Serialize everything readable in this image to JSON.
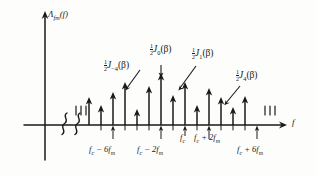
{
  "figure": {
    "kind": "fm-spectrum-line-diagram",
    "y_axis_label": {
      "main": "Λ",
      "sub": "fm",
      "arg": "(f)"
    },
    "x_axis_label": "f"
  },
  "annotations": [
    {
      "id": "j-minus-4",
      "frac_num": "1",
      "frac_den": "2",
      "symbol": "J",
      "order": "−4",
      "arg": "(β)"
    },
    {
      "id": "j-0",
      "frac_num": "1",
      "frac_den": "2",
      "symbol": "J",
      "order": "0",
      "arg": "(β)"
    },
    {
      "id": "j-1",
      "frac_num": "1",
      "frac_den": "2",
      "symbol": "J",
      "order": "1",
      "arg": "(β)"
    },
    {
      "id": "j-4",
      "frac_num": "1",
      "frac_den": "2",
      "symbol": "J",
      "order": "4",
      "arg": "(β)"
    }
  ],
  "x_tick_labels": [
    {
      "id": "fc-minus-6fm",
      "text": "f",
      "sub1": "c",
      "op": "− 6",
      "text2": "f",
      "sub2": "m"
    },
    {
      "id": "fc-minus-2fm",
      "text": "f",
      "sub1": "c",
      "op": "− 2",
      "text2": "f",
      "sub2": "m"
    },
    {
      "id": "fc",
      "text": "f",
      "sub1": "c",
      "op": "",
      "text2": "",
      "sub2": ""
    },
    {
      "id": "fc-plus-2fm",
      "text": "f",
      "sub1": "c",
      "op": "+ 2",
      "text2": "f",
      "sub2": "m"
    },
    {
      "id": "fc-plus-6fm",
      "text": "f",
      "sub1": "c",
      "op": "+ 6",
      "text2": "f",
      "sub2": "m"
    }
  ],
  "chart_data": {
    "type": "bar",
    "title": "",
    "xlabel": "f",
    "ylabel": "Λ_fm(f)",
    "grid": false,
    "legend": null,
    "axis_break_count": 2,
    "ellipsis_ticks_left": 3,
    "ellipsis_ticks_right": 3,
    "categories": [
      "fc-8fm",
      "fc-7fm",
      "fc-6fm",
      "fc-5fm",
      "fc-4fm",
      "fc-3fm",
      "fc-2fm",
      "fc-1fm",
      "fc",
      "fc+1fm",
      "fc+2fm",
      "fc+3fm",
      "fc+4fm",
      "fc+5fm",
      "fc+6fm",
      "fc+7fm"
    ],
    "x_px": [
      89,
      101,
      113,
      125,
      137,
      149,
      161,
      173,
      185,
      197,
      209,
      221,
      233,
      245,
      257,
      269
    ],
    "values": [
      28,
      20,
      33,
      43,
      16,
      39,
      52,
      30,
      43,
      20,
      37,
      28,
      18,
      29,
      0,
      0
    ],
    "ylim": [
      0,
      55
    ],
    "annotation_targets": {
      "j-minus-4": "fc-5fm",
      "j-0": "fc-2fm",
      "j-1": "fc-1fm",
      "j-4": "fc+3fm"
    },
    "labeled_ticks_px": [
      113,
      161,
      185,
      209,
      257
    ]
  },
  "colors": {
    "ink": "#1a1a1a",
    "paper": "#fdfdfb"
  }
}
